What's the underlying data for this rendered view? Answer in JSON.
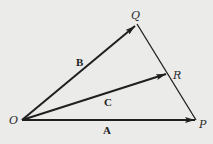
{
  "diagram": {
    "background": "#ebebea",
    "line_color": "#1f1f1f",
    "points": {
      "O": {
        "label": "O",
        "x": 22,
        "y": 120
      },
      "P": {
        "label": "P",
        "x": 196,
        "y": 120
      },
      "Q": {
        "label": "Q",
        "x": 137,
        "y": 24
      },
      "R": {
        "label": "R",
        "x": 167,
        "y": 74
      }
    },
    "vectors": [
      {
        "name": "A",
        "label": "A",
        "from": "O",
        "to": "P"
      },
      {
        "name": "B",
        "label": "B",
        "from": "O",
        "to": "Q"
      },
      {
        "name": "C",
        "label": "C",
        "from": "O",
        "to": "R"
      }
    ],
    "segments": [
      {
        "from": "Q",
        "to": "P"
      }
    ]
  }
}
